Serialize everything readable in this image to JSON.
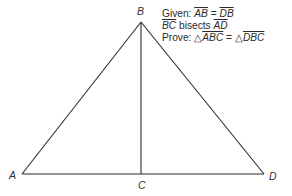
{
  "figure": {
    "vertices": {
      "A": {
        "label": "A",
        "x": 22,
        "y": 174
      },
      "B": {
        "label": "B",
        "x": 141,
        "y": 22
      },
      "C": {
        "label": "C",
        "x": 141,
        "y": 174
      },
      "D": {
        "label": "D",
        "x": 264,
        "y": 174
      }
    },
    "segments": [
      "AB",
      "BD",
      "AD",
      "BC"
    ]
  },
  "proof": {
    "given_label": "Given:",
    "given_lhs": "AB",
    "given_eq": "=",
    "given_rhs": "DB",
    "bisect_seg": "BC",
    "bisect_word": "bisects",
    "bisect_target": "AD",
    "prove_label": "Prove:",
    "triangle_symbol": "△",
    "prove_lhs": "ABC",
    "prove_eq": "=",
    "prove_rhs": "DBC"
  }
}
